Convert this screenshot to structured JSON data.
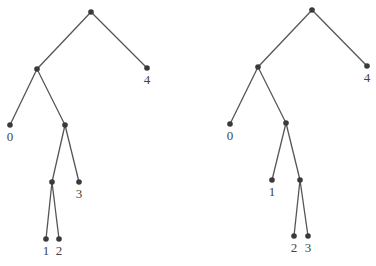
{
  "trees": [
    {
      "name": "left-tree",
      "nodes": [
        {
          "id": "r",
          "x": 91,
          "y": 12,
          "label": ""
        },
        {
          "id": "a",
          "x": 37,
          "y": 69,
          "label": ""
        },
        {
          "id": "l4",
          "x": 147,
          "y": 68,
          "label": "4"
        },
        {
          "id": "l0",
          "x": 10,
          "y": 125,
          "label": "0"
        },
        {
          "id": "b",
          "x": 65,
          "y": 125,
          "label": ""
        },
        {
          "id": "c",
          "x": 52,
          "y": 182,
          "label": ""
        },
        {
          "id": "l3",
          "x": 79,
          "y": 182,
          "label": "3"
        },
        {
          "id": "l1",
          "x": 46,
          "y": 239,
          "label": "1"
        },
        {
          "id": "l2",
          "x": 59,
          "y": 239,
          "label": "2"
        }
      ],
      "edges": [
        [
          "r",
          "a"
        ],
        [
          "r",
          "l4"
        ],
        [
          "a",
          "l0"
        ],
        [
          "a",
          "b"
        ],
        [
          "b",
          "c"
        ],
        [
          "b",
          "l3"
        ],
        [
          "c",
          "l1"
        ],
        [
          "c",
          "l2"
        ]
      ]
    },
    {
      "name": "right-tree",
      "nodes": [
        {
          "id": "r",
          "x": 312,
          "y": 10,
          "label": ""
        },
        {
          "id": "a",
          "x": 258,
          "y": 67,
          "label": ""
        },
        {
          "id": "l4",
          "x": 367,
          "y": 66,
          "label": "4"
        },
        {
          "id": "l0",
          "x": 230,
          "y": 124,
          "label": "0"
        },
        {
          "id": "b",
          "x": 286,
          "y": 123,
          "label": ""
        },
        {
          "id": "l1",
          "x": 272,
          "y": 180,
          "label": "1"
        },
        {
          "id": "c",
          "x": 300,
          "y": 180,
          "label": ""
        },
        {
          "id": "l2",
          "x": 294,
          "y": 236,
          "label": "2"
        },
        {
          "id": "l3",
          "x": 308,
          "y": 236,
          "label": "3"
        }
      ],
      "edges": [
        [
          "r",
          "a"
        ],
        [
          "r",
          "l4"
        ],
        [
          "a",
          "l0"
        ],
        [
          "a",
          "b"
        ],
        [
          "b",
          "l1"
        ],
        [
          "b",
          "c"
        ],
        [
          "c",
          "l2"
        ],
        [
          "c",
          "l3"
        ]
      ]
    }
  ],
  "style": {
    "edge_color": "#555555",
    "node_color": "#3a3a3a",
    "label_color": "#444444"
  }
}
